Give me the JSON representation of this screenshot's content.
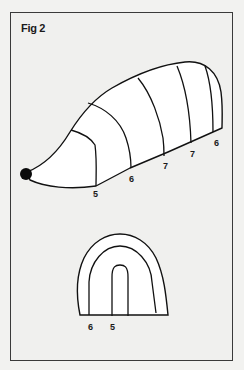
{
  "figure": {
    "title": "Fig 2",
    "side_view": {
      "description": "Hedgehog shape divided into bands",
      "labels": [
        "5",
        "6",
        "7",
        "7",
        "6"
      ]
    },
    "front_view": {
      "description": "Arch cross-section with nested bands",
      "labels": [
        "6",
        "5"
      ]
    }
  }
}
